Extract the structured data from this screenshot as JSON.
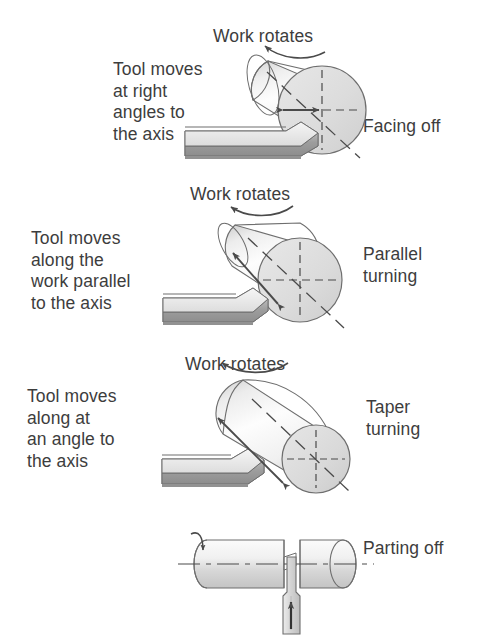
{
  "figure": {
    "type": "technical-illustration",
    "panel_count": 4
  },
  "panels": [
    {
      "id": "facing-off",
      "description": "Tool moves\nat right\nangles to\nthe axis",
      "rotation_label": "Work rotates",
      "operation_label": "Facing off",
      "motion": "perpendicular-to-axis",
      "tool_arrow": "horizontal double arrow at workpiece face"
    },
    {
      "id": "parallel-turning",
      "description": "Tool moves\nalong the\nwork parallel\nto the axis",
      "rotation_label": "Work rotates",
      "operation_label": "Parallel\nturning",
      "motion": "parallel-to-axis",
      "tool_arrow": "double arrow along cylinder axis"
    },
    {
      "id": "taper-turning",
      "description": "Tool moves\nalong at\nan angle to\nthe axis",
      "rotation_label": "Work rotates",
      "operation_label": "Taper\nturning",
      "motion": "angled-to-axis",
      "tool_arrow": "double arrow along tapered surface"
    },
    {
      "id": "parting-off",
      "description": "",
      "rotation_label": "",
      "operation_label": "Parting off",
      "motion": "radial-inward",
      "tool_arrow": "vertical up arrow on parting blade"
    }
  ],
  "colors": {
    "outline": "#6e6e6e",
    "text": "#3d3d3d",
    "cylinder_light": "#fdfdfd",
    "cylinder_shade": "#c9c9c9",
    "tool_top": "#e9e9e9",
    "tool_front": "#9a9a9a",
    "tool_side": "#b5b5b5",
    "centerline": "#6e6e6e",
    "background": "#ffffff"
  }
}
